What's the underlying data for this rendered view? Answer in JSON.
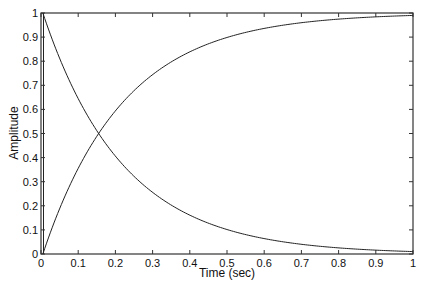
{
  "chart_data": {
    "type": "line",
    "title": "",
    "xlabel": "Time (sec)",
    "ylabel": "Amplitude",
    "xlim": [
      0,
      1
    ],
    "ylim": [
      0,
      1
    ],
    "grid": false,
    "legend": null,
    "xticks": [
      "0",
      "0.1",
      "0.2",
      "0.3",
      "0.4",
      "0.5",
      "0.6",
      "0.7",
      "0.8",
      "0.9",
      "1"
    ],
    "yticks": [
      "0",
      "0.1",
      "0.2",
      "0.3",
      "0.4",
      "0.5",
      "0.6",
      "0.7",
      "0.8",
      "0.9",
      "1"
    ],
    "series": [
      {
        "name": "decaying response",
        "x": [
          0,
          0.05,
          0.1,
          0.15,
          0.2,
          0.3,
          0.4,
          0.5,
          0.6,
          0.7,
          0.8,
          0.9,
          1.0
        ],
        "values": [
          1.0,
          0.79,
          0.63,
          0.5,
          0.4,
          0.25,
          0.16,
          0.1,
          0.06,
          0.04,
          0.025,
          0.016,
          0.01
        ]
      },
      {
        "name": "rising response",
        "x": [
          0,
          0.05,
          0.1,
          0.15,
          0.2,
          0.3,
          0.4,
          0.5,
          0.6,
          0.7,
          0.8,
          0.9,
          1.0
        ],
        "values": [
          0.0,
          0.21,
          0.37,
          0.5,
          0.6,
          0.75,
          0.84,
          0.9,
          0.94,
          0.96,
          0.975,
          0.984,
          0.99
        ]
      }
    ],
    "annotations": [
      "curves intersect at approximately t = 0.15, amplitude = 0.5"
    ]
  },
  "axes": {
    "xlabel": "Time (sec)",
    "ylabel": "Amplitude"
  },
  "colors": {
    "line": "#222222",
    "axes": "#333333",
    "background": "#ffffff"
  }
}
